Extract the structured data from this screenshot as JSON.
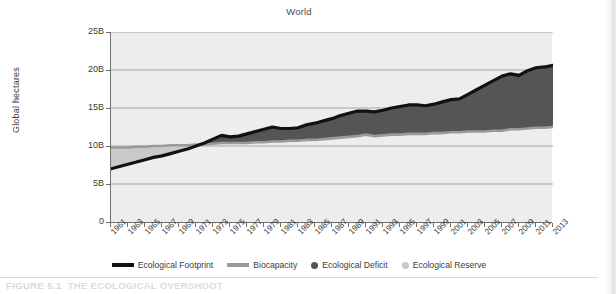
{
  "figure": {
    "caption_number": "FIGURE 5.1",
    "caption_title": "THE ECOLOGICAL OVERSHOOT"
  },
  "colors": {
    "footprint_line": "#111111",
    "biocapacity_line": "#9a9a9a",
    "deficit_fill": "#555555",
    "reserve_fill": "#c9c9c9",
    "plot_background": "#ededed",
    "gridline": "#9d9d9d",
    "axis": "#6f6f6f",
    "text": "#3c3c3c"
  },
  "chart_data": {
    "type": "area",
    "title": "World",
    "xlabel": "",
    "ylabel": "Global hectares",
    "xlim": [
      1961,
      2013
    ],
    "ylim": [
      0,
      25
    ],
    "ytick_labels": [
      "0",
      "5B",
      "10B",
      "15B",
      "20B",
      "25B"
    ],
    "ytick_values": [
      0,
      5,
      10,
      15,
      20,
      25
    ],
    "grid": true,
    "grid_axis": "y",
    "legend_position": "bottom",
    "units": "billions of global hectares",
    "x": [
      1961,
      1962,
      1963,
      1964,
      1965,
      1966,
      1967,
      1968,
      1969,
      1970,
      1971,
      1972,
      1973,
      1974,
      1975,
      1976,
      1977,
      1978,
      1979,
      1980,
      1981,
      1982,
      1983,
      1984,
      1985,
      1986,
      1987,
      1988,
      1989,
      1990,
      1991,
      1992,
      1993,
      1994,
      1995,
      1996,
      1997,
      1998,
      1999,
      2000,
      2001,
      2002,
      2003,
      2004,
      2005,
      2006,
      2007,
      2008,
      2009,
      2010,
      2011,
      2012,
      2013
    ],
    "xtick_labels": [
      "1961",
      "1963",
      "1965",
      "1967",
      "1969",
      "1971",
      "1973",
      "1975",
      "1977",
      "1979",
      "1981",
      "1983",
      "1985",
      "1987",
      "1989",
      "1991",
      "1993",
      "1995",
      "1997",
      "1999",
      "2001",
      "2003",
      "2005",
      "2007",
      "2009",
      "2011",
      "2013"
    ],
    "series": [
      {
        "name": "Ecological Footprint",
        "style": "line",
        "color": "#111111",
        "values": [
          7.0,
          7.3,
          7.6,
          7.9,
          8.2,
          8.5,
          8.7,
          9.0,
          9.3,
          9.6,
          10.0,
          10.4,
          10.9,
          11.4,
          11.2,
          11.3,
          11.6,
          11.9,
          12.2,
          12.5,
          12.3,
          12.3,
          12.4,
          12.8,
          13.0,
          13.3,
          13.6,
          14.0,
          14.3,
          14.6,
          14.6,
          14.5,
          14.7,
          15.0,
          15.2,
          15.4,
          15.4,
          15.3,
          15.5,
          15.8,
          16.1,
          16.2,
          16.8,
          17.4,
          18.0,
          18.6,
          19.2,
          19.5,
          19.3,
          19.9,
          20.3,
          20.4,
          20.6
        ]
      },
      {
        "name": "Biocapacity",
        "style": "line",
        "color": "#9a9a9a",
        "values": [
          9.8,
          9.8,
          9.8,
          9.9,
          9.9,
          10.0,
          10.0,
          10.1,
          10.1,
          10.1,
          10.2,
          10.2,
          10.3,
          10.4,
          10.4,
          10.4,
          10.4,
          10.5,
          10.5,
          10.6,
          10.6,
          10.7,
          10.7,
          10.8,
          10.8,
          10.9,
          11.0,
          11.1,
          11.2,
          11.3,
          11.5,
          11.3,
          11.4,
          11.5,
          11.5,
          11.6,
          11.6,
          11.6,
          11.7,
          11.7,
          11.8,
          11.8,
          11.9,
          11.9,
          11.9,
          12.0,
          12.0,
          12.2,
          12.2,
          12.3,
          12.4,
          12.4,
          12.5
        ]
      }
    ],
    "fills": [
      {
        "name": "Ecological Deficit",
        "color": "#555555",
        "between": [
          "Biocapacity",
          "Ecological Footprint"
        ],
        "when": "footprint > biocapacity"
      },
      {
        "name": "Ecological Reserve",
        "color": "#c9c9c9",
        "between": [
          "Ecological Footprint",
          "Biocapacity"
        ],
        "when": "biocapacity > footprint"
      }
    ],
    "legend": [
      {
        "label": "Ecological Footprint",
        "marker": "line",
        "color": "#111111"
      },
      {
        "label": "Biocapacity",
        "marker": "line",
        "color": "#9a9a9a"
      },
      {
        "label": "Ecological Deficit",
        "marker": "dot",
        "color": "#555555"
      },
      {
        "label": "Ecological Reserve",
        "marker": "dot",
        "color": "#c9c9c9"
      }
    ]
  }
}
